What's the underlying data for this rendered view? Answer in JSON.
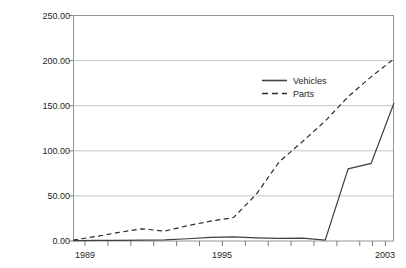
{
  "chart_data": {
    "type": "line",
    "title": "",
    "xlabel": "",
    "ylabel": "Value in constant 2000 US$ million",
    "xlim": [
      1989,
      2003
    ],
    "ylim": [
      0,
      250
    ],
    "grid": "horizontal",
    "legend_position": "inside-upper-center",
    "x": [
      1989,
      1990,
      1991,
      1992,
      1993,
      1994,
      1995,
      1996,
      1997,
      1998,
      1999,
      2000,
      2001,
      2002,
      2003
    ],
    "xticks": [
      1989,
      1990,
      1991,
      1992,
      1993,
      1994,
      1995,
      1996,
      1997,
      1998,
      1999,
      2000,
      2001,
      2002,
      2003
    ],
    "xticklabels": [
      "1989",
      "",
      "",
      "",
      "",
      "",
      "1995",
      "",
      "",
      "",
      "",
      "",
      "",
      "",
      "2003"
    ],
    "yticks": [
      0,
      50,
      100,
      150,
      200,
      250
    ],
    "yticklabels": [
      "0.00",
      "50.00",
      "100.00",
      "150.00",
      "200.00",
      "250.00"
    ],
    "series": [
      {
        "name": "Vehicles",
        "style": "solid",
        "color": "#404040",
        "values": [
          0.5,
          0.6,
          0.8,
          1.0,
          1.2,
          2.5,
          4.0,
          4.5,
          3.5,
          3.0,
          3.2,
          1.0,
          80.0,
          86.0,
          153.0
        ]
      },
      {
        "name": "Parts",
        "style": "dashed",
        "color": "#2b2b2b",
        "values": [
          1.0,
          5.0,
          9.5,
          13.5,
          11.0,
          17.0,
          22.0,
          26.0,
          52.0,
          88.0,
          110.0,
          133.0,
          160.0,
          182.0,
          202.0
        ]
      }
    ]
  },
  "legend": {
    "items": [
      {
        "label": "Vehicles",
        "style": "solid"
      },
      {
        "label": "Parts",
        "style": "dashed"
      }
    ]
  },
  "axis": {
    "ylabel": "Value in constant 2000 US$ million"
  }
}
